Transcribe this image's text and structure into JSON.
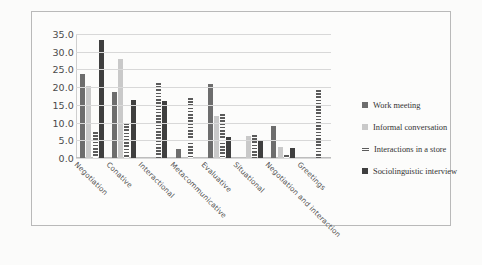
{
  "chart_data": {
    "type": "bar",
    "title": "",
    "xlabel": "",
    "ylabel": "",
    "ylim": [
      0,
      35
    ],
    "ytick_step": 5,
    "grid": true,
    "legend_position": "right",
    "ytick_labels": [
      "35.0",
      "30.0",
      "25.0",
      "20.0",
      "15.0",
      "10.0",
      "5.0",
      "0.0"
    ],
    "categories": [
      "Negotiation",
      "Conative",
      "Interactional",
      "Metacommunicative",
      "Evaluative",
      "Situational",
      "Negotiation and interaction",
      "Greetings"
    ],
    "series": [
      {
        "name": "Work meeting",
        "color": "#6d6d6d",
        "values": [
          23.8,
          18.6,
          0.0,
          2.6,
          21.0,
          0.0,
          9.0,
          0.0
        ]
      },
      {
        "name": "Informal conversation",
        "color": "#c9c9c9",
        "values": [
          20.2,
          28.0,
          0.0,
          0.0,
          12.0,
          6.1,
          3.0,
          0.0
        ]
      },
      {
        "name": "Interactions in a store",
        "color": "#5b5b5b",
        "pattern": "horizontal-stripes",
        "values": [
          7.4,
          9.8,
          21.3,
          17.0,
          12.3,
          6.4,
          0.8,
          19.2
        ]
      },
      {
        "name": "Sociolinguistic interview",
        "color": "#3f3f3f",
        "values": [
          33.2,
          16.5,
          16.0,
          0.0,
          6.0,
          5.2,
          2.8,
          0.0
        ]
      }
    ]
  },
  "legend": {
    "items": [
      {
        "label": "Work meeting"
      },
      {
        "label": "Informal conversation"
      },
      {
        "label": "Interactions in a store"
      },
      {
        "label": "Sociolinguistic interview"
      }
    ]
  }
}
